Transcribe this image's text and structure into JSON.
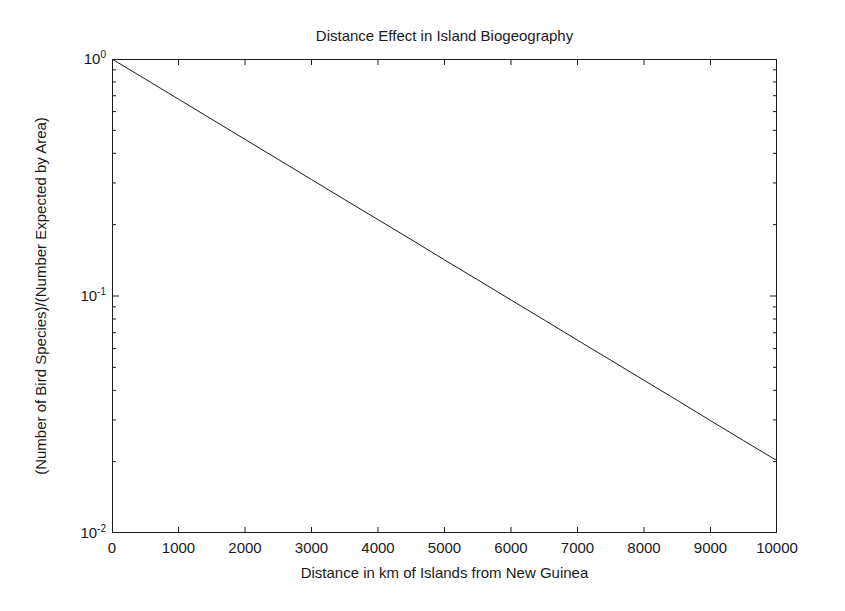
{
  "chart_data": {
    "type": "line",
    "title": "Distance Effect in Island Biogeography",
    "xlabel": "Distance in km of Islands from New Guinea",
    "ylabel": "(Number of Bird Species)/(Number Expected by Area)",
    "xscale": "linear",
    "yscale": "log",
    "xlim": [
      0,
      10000
    ],
    "ylim": [
      0.01,
      1
    ],
    "grid": false,
    "legend": null,
    "x_ticks": [
      0,
      1000,
      2000,
      3000,
      4000,
      5000,
      6000,
      7000,
      8000,
      9000,
      10000
    ],
    "x_tick_labels": [
      "0",
      "1000",
      "2000",
      "3000",
      "4000",
      "5000",
      "6000",
      "7000",
      "8000",
      "9000",
      "10000"
    ],
    "y_ticks": [
      1,
      0.1,
      0.01
    ],
    "y_tick_labels": [
      "10⁰",
      "10⁻¹",
      "10⁻²"
    ],
    "y_tick_mantissas": [
      "10",
      "10",
      "10"
    ],
    "y_tick_exponents": [
      "0",
      "-1",
      "-2"
    ],
    "series": [
      {
        "name": "Relative bird species richness",
        "color": "#1a1a1a",
        "line_width": 1,
        "x": [
          0,
          500,
          1000,
          1500,
          2000,
          2500,
          3000,
          3500,
          4000,
          4500,
          5000,
          5500,
          6000,
          6500,
          7000,
          7500,
          8000,
          8500,
          9000,
          9500,
          10000
        ],
        "y": [
          1.0,
          0.823,
          0.677,
          0.557,
          0.458,
          0.377,
          0.31,
          0.255,
          0.21,
          0.173,
          0.142,
          0.117,
          0.0962,
          0.0792,
          0.0651,
          0.0536,
          0.0441,
          0.0363,
          0.0298,
          0.0245,
          0.0202
        ]
      }
    ]
  },
  "figure": {
    "background_color": "#ffffff",
    "axis_color": "#1a1a1a"
  }
}
